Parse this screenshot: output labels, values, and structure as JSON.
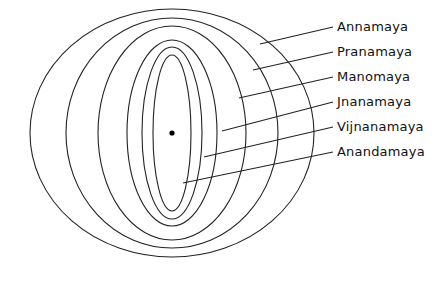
{
  "diagram": {
    "stroke_color": "#222222",
    "center": {
      "x": 172,
      "y": 133
    },
    "sheaths": [
      {
        "label": "Annamaya",
        "rx": 142,
        "ry": 124,
        "label_x": 337,
        "label_y": 20,
        "line": [
          260,
          44,
          333,
          27
        ]
      },
      {
        "label": "Pranamaya",
        "rx": 106,
        "ry": 115,
        "label_x": 337,
        "label_y": 45,
        "line": [
          253,
          70,
          333,
          52
        ]
      },
      {
        "label": "Manomaya",
        "rx": 74,
        "ry": 107,
        "label_x": 337,
        "label_y": 70,
        "line": [
          239,
          98,
          333,
          77
        ]
      },
      {
        "label": "Jnanamaya",
        "rx": 45,
        "ry": 93,
        "label_x": 337,
        "label_y": 95,
        "line": [
          222,
          131,
          333,
          102
        ]
      },
      {
        "label": "Vijnanamaya",
        "rx": 30,
        "ry": 86,
        "label_x": 337,
        "label_y": 120,
        "line": [
          204,
          157,
          333,
          127
        ]
      },
      {
        "label": "Anandamaya",
        "rx": 19,
        "ry": 78,
        "label_x": 337,
        "label_y": 145,
        "line": [
          183,
          183,
          333,
          152
        ]
      }
    ]
  }
}
